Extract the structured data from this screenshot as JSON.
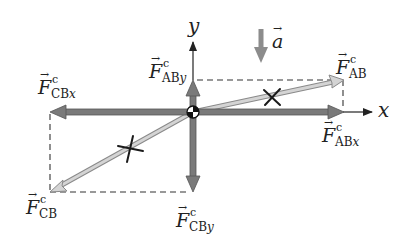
{
  "diagram": {
    "colors": {
      "component_arrow": "#7a7a7a",
      "resultant_arrow": "#c8c8c8",
      "axis": "#222222",
      "dashed_line": "#333333",
      "accel_arrow": "#8c8c8c",
      "x_mark": "#1a1a1a"
    },
    "axes": {
      "x_label": "x",
      "y_label": "y"
    },
    "acceleration": {
      "symbol": "a",
      "vector_mark": "→",
      "direction": "down"
    },
    "forces": [
      {
        "id": "F_AB",
        "symbol": "F",
        "superscript": "c",
        "subscript": "AB",
        "subscript_italic": "",
        "kind": "resultant",
        "direction": "up-right"
      },
      {
        "id": "F_ABx",
        "symbol": "F",
        "superscript": "c",
        "subscript": "AB",
        "subscript_italic": "x",
        "kind": "component",
        "direction": "right"
      },
      {
        "id": "F_ABy",
        "symbol": "F",
        "superscript": "c",
        "subscript": "AB",
        "subscript_italic": "y",
        "kind": "component",
        "direction": "up"
      },
      {
        "id": "F_CB",
        "symbol": "F",
        "superscript": "c",
        "subscript": "CB",
        "subscript_italic": "",
        "kind": "resultant",
        "direction": "down-left"
      },
      {
        "id": "F_CBx",
        "symbol": "F",
        "superscript": "c",
        "subscript": "CB",
        "subscript_italic": "x",
        "kind": "component",
        "direction": "left"
      },
      {
        "id": "F_CBy",
        "symbol": "F",
        "superscript": "c",
        "subscript": "CB",
        "subscript_italic": "y",
        "kind": "component",
        "direction": "down"
      }
    ],
    "vector_mark": "→",
    "cross_marks": 2
  }
}
